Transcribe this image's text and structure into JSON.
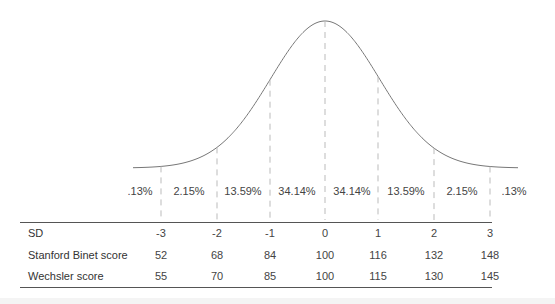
{
  "chart_data": {
    "type": "line",
    "title": "",
    "xlabel": "SD",
    "ylabel": "",
    "grid": false,
    "x": [
      -3,
      -2,
      -1,
      0,
      1,
      2,
      3
    ],
    "band_percentages": [
      ".13%",
      "2.15%",
      "13.59%",
      "34.14%",
      "34.14%",
      "13.59%",
      "2.15%",
      ".13%"
    ],
    "table": {
      "rows": [
        {
          "label": "SD",
          "values": [
            "-3",
            "-2",
            "-1",
            "0",
            "1",
            "2",
            "3"
          ]
        },
        {
          "label": "Stanford Binet score",
          "values": [
            "52",
            "68",
            "84",
            "100",
            "116",
            "132",
            "148"
          ]
        },
        {
          "label": "Wechsler score",
          "values": [
            "55",
            "70",
            "85",
            "100",
            "115",
            "130",
            "145"
          ]
        }
      ]
    },
    "colors": {
      "curve": "#777777",
      "dashes": "#bbbbbb",
      "text": "#444444"
    }
  }
}
